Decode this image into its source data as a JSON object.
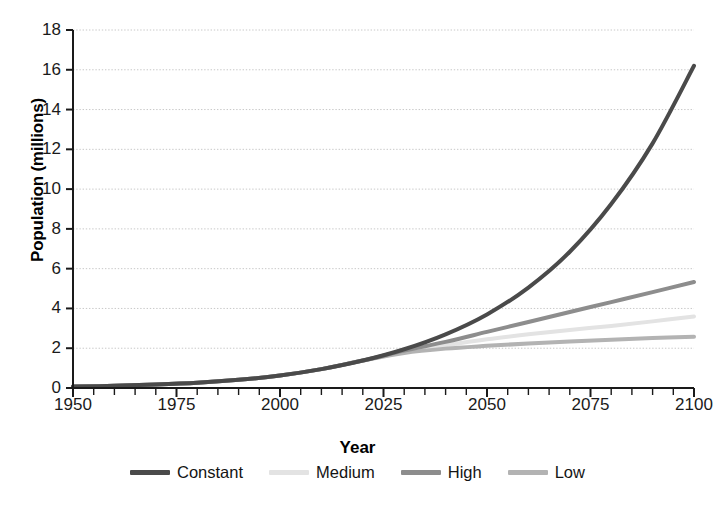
{
  "chart_data": {
    "type": "line",
    "title": "",
    "xlabel": "Year",
    "ylabel": "Population (millions)",
    "xlim": [
      1950,
      2100
    ],
    "ylim": [
      0,
      18
    ],
    "xticks": [
      1950,
      1975,
      2000,
      2025,
      2050,
      2075,
      2100
    ],
    "xtick_labels": [
      "1950",
      "1975",
      "2000",
      "2025",
      "2050",
      "2075",
      "2100"
    ],
    "x_minor_tick_step": 5,
    "yticks": [
      0,
      2,
      4,
      6,
      8,
      10,
      12,
      14,
      16,
      18
    ],
    "ytick_labels": [
      "0",
      "2",
      "4",
      "6",
      "8",
      "10",
      "12",
      "14",
      "16",
      "18"
    ],
    "grid": "horizontal-dotted",
    "legend_position": "bottom",
    "x": [
      1950,
      1960,
      1970,
      1980,
      1990,
      2000,
      2010,
      2020,
      2030,
      2040,
      2050,
      2060,
      2070,
      2080,
      2090,
      2100
    ],
    "series": [
      {
        "name": "Constant",
        "color": "#4a4a4a",
        "width": 4.0,
        "values": [
          0.07,
          0.11,
          0.17,
          0.26,
          0.41,
          0.63,
          0.95,
          1.38,
          1.95,
          2.7,
          3.7,
          5.05,
          6.85,
          9.25,
          12.3,
          16.2
        ]
      },
      {
        "name": "Medium",
        "color": "#e3e3e3",
        "width": 4.0,
        "values": [
          0.07,
          0.11,
          0.17,
          0.26,
          0.41,
          0.63,
          0.95,
          1.38,
          1.82,
          2.15,
          2.45,
          2.7,
          2.92,
          3.12,
          3.35,
          3.6
        ]
      },
      {
        "name": "High",
        "color": "#8d8d8d",
        "width": 4.0,
        "values": [
          0.07,
          0.11,
          0.17,
          0.26,
          0.41,
          0.63,
          0.95,
          1.38,
          1.88,
          2.32,
          2.82,
          3.32,
          3.82,
          4.32,
          4.82,
          5.33
        ]
      },
      {
        "name": "Low",
        "color": "#b3b3b3",
        "width": 4.0,
        "values": [
          0.07,
          0.11,
          0.17,
          0.26,
          0.41,
          0.63,
          0.95,
          1.38,
          1.76,
          1.98,
          2.12,
          2.24,
          2.34,
          2.43,
          2.51,
          2.58
        ]
      }
    ],
    "annotations": []
  },
  "legend": {
    "items": [
      {
        "label": "Constant",
        "color": "#4a4a4a"
      },
      {
        "label": "Medium",
        "color": "#e3e3e3"
      },
      {
        "label": "High",
        "color": "#8d8d8d"
      },
      {
        "label": "Low",
        "color": "#b3b3b3"
      }
    ]
  },
  "colors": {
    "axis": "#1a1a1a",
    "grid": "#c8c8c8",
    "text": "#1a1a1a",
    "background": "#ffffff"
  }
}
